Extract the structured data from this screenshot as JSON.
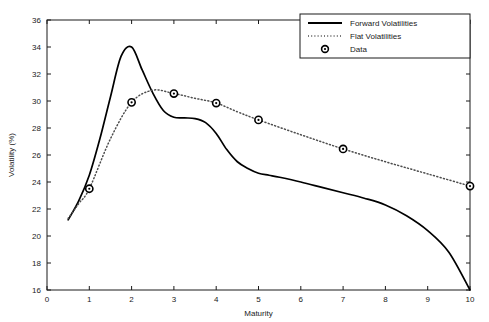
{
  "chart_data": {
    "type": "line",
    "title": "",
    "xlabel": "Maturity",
    "ylabel": "Volatility (%)",
    "xlim": [
      0,
      10
    ],
    "ylim": [
      16,
      36
    ],
    "xticks": [
      "0",
      "1",
      "2",
      "3",
      "4",
      "5",
      "6",
      "7",
      "8",
      "9",
      "10"
    ],
    "yticks": [
      "16",
      "18",
      "20",
      "22",
      "24",
      "26",
      "28",
      "30",
      "32",
      "34",
      "36"
    ],
    "grid": false,
    "legend_position": "top-right",
    "legend": [
      {
        "label": "Forward Volatilities",
        "style": "solid-line",
        "color": "#000000"
      },
      {
        "label": "Flat Volatilities",
        "style": "dotted-line",
        "color": "#4d4d4d"
      },
      {
        "label": "Data",
        "style": "circle-marker",
        "color": "#000000"
      }
    ],
    "series": [
      {
        "name": "Forward Volatilities",
        "style": "solid",
        "x": [
          0.5,
          0.75,
          1.0,
          1.25,
          1.5,
          1.75,
          2.0,
          2.25,
          2.5,
          2.75,
          3.0,
          3.25,
          3.5,
          3.75,
          4.0,
          4.25,
          4.5,
          4.75,
          5.0,
          5.25,
          5.5,
          6.0,
          6.5,
          7.0,
          7.5,
          8.0,
          8.5,
          9.0,
          9.5,
          10.0
        ],
        "y": [
          21.2,
          22.6,
          24.5,
          27.2,
          30.3,
          33.3,
          34.0,
          32.3,
          30.6,
          29.3,
          28.8,
          28.75,
          28.7,
          28.4,
          27.6,
          26.4,
          25.5,
          25.0,
          24.65,
          24.5,
          24.35,
          24.0,
          23.6,
          23.2,
          22.8,
          22.3,
          21.5,
          20.4,
          18.8,
          16.0
        ]
      },
      {
        "name": "Flat Volatilities",
        "style": "dotted",
        "x": [
          0.5,
          0.75,
          1.0,
          1.5,
          2.0,
          2.5,
          3.0,
          3.5,
          4.0,
          4.5,
          5.0,
          6.0,
          7.0,
          8.0,
          9.0,
          10.0
        ],
        "y": [
          21.3,
          22.4,
          23.5,
          27.2,
          29.9,
          30.8,
          30.55,
          30.2,
          29.85,
          29.2,
          28.6,
          27.5,
          26.45,
          25.5,
          24.6,
          23.7
        ]
      }
    ],
    "data_points": {
      "name": "Data",
      "x": [
        1,
        2,
        3,
        4,
        5,
        7,
        10
      ],
      "y": [
        23.5,
        29.9,
        30.55,
        29.85,
        28.6,
        26.45,
        23.7
      ]
    }
  }
}
